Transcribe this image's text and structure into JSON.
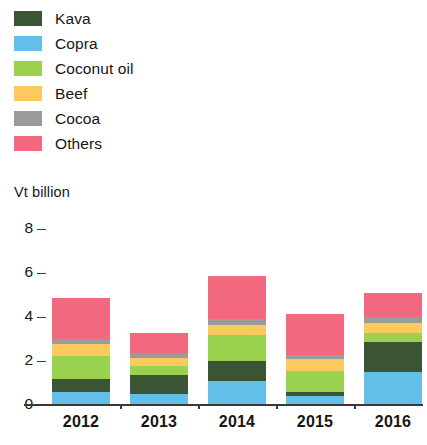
{
  "unit_label": "Vt billion",
  "colors": {
    "kava": "#3b5434",
    "copra": "#63bee8",
    "coconut_oil": "#9ad14e",
    "beef": "#fbc95e",
    "cocoa": "#9b9b9b",
    "others": "#f2697f",
    "axis": "#3a3a3a",
    "text": "#161616",
    "background": "#ffffff"
  },
  "legend": {
    "items": [
      {
        "label": "Kava",
        "key": "kava"
      },
      {
        "label": "Copra",
        "key": "copra"
      },
      {
        "label": "Coconut oil",
        "key": "coconut_oil"
      },
      {
        "label": "Beef",
        "key": "beef"
      },
      {
        "label": "Cocoa",
        "key": "cocoa"
      },
      {
        "label": "Others",
        "key": "others"
      }
    ]
  },
  "chart_data": {
    "type": "bar",
    "stacked": true,
    "title": "",
    "subtitle": "",
    "xlabel": "",
    "ylabel": "Vt billion",
    "ylim": [
      0,
      8
    ],
    "yticks": [
      0,
      2,
      4,
      6,
      8
    ],
    "ytick_labels": [
      "0",
      "2",
      "4",
      "6",
      "8"
    ],
    "grid": false,
    "legend_position": "top-left",
    "categories": [
      "2012",
      "2013",
      "2014",
      "2015",
      "2016"
    ],
    "series": [
      {
        "name": "Copra",
        "color": "#63bee8",
        "values": [
          0.55,
          0.45,
          1.05,
          0.35,
          1.45
        ]
      },
      {
        "name": "Kava",
        "color": "#3b5434",
        "values": [
          0.6,
          0.85,
          0.9,
          0.2,
          1.35
        ]
      },
      {
        "name": "Coconut oil",
        "color": "#9ad14e",
        "values": [
          1.05,
          0.45,
          1.2,
          0.95,
          0.45
        ]
      },
      {
        "name": "Beef",
        "color": "#fbc95e",
        "values": [
          0.55,
          0.35,
          0.45,
          0.55,
          0.45
        ]
      },
      {
        "name": "Cocoa",
        "color": "#9b9b9b",
        "values": [
          0.2,
          0.2,
          0.25,
          0.2,
          0.25
        ]
      },
      {
        "name": "Others",
        "color": "#f2697f",
        "values": [
          1.85,
          0.95,
          1.95,
          1.85,
          1.1
        ]
      }
    ],
    "totals": [
      4.8,
      3.25,
      5.8,
      4.1,
      5.05
    ]
  }
}
